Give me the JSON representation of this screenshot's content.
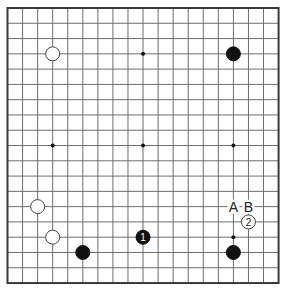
{
  "board": {
    "size": 19,
    "origin_x": 7.5,
    "origin_y": 8,
    "spacing_x": 15.06,
    "spacing_y": 15.28,
    "line_color": "#6e6e6e",
    "border_color": "#3a3a3a",
    "background": "#ffffff"
  },
  "star_points": [
    {
      "col": 3,
      "row": 3
    },
    {
      "col": 9,
      "row": 3
    },
    {
      "col": 15,
      "row": 3
    },
    {
      "col": 3,
      "row": 9
    },
    {
      "col": 9,
      "row": 9
    },
    {
      "col": 15,
      "row": 9
    },
    {
      "col": 3,
      "row": 15
    },
    {
      "col": 9,
      "row": 15
    },
    {
      "col": 15,
      "row": 15
    }
  ],
  "stones": [
    {
      "color": "white",
      "col": 3,
      "row": 3,
      "label": ""
    },
    {
      "color": "black",
      "col": 15,
      "row": 3,
      "label": ""
    },
    {
      "color": "white",
      "col": 2,
      "row": 13,
      "label": ""
    },
    {
      "color": "white",
      "col": 3,
      "row": 15,
      "label": ""
    },
    {
      "color": "black",
      "col": 5,
      "row": 16,
      "label": ""
    },
    {
      "color": "black",
      "col": 9,
      "row": 15,
      "label": "1"
    },
    {
      "color": "white",
      "col": 16,
      "row": 14,
      "label": "2"
    },
    {
      "color": "black",
      "col": 15,
      "row": 16,
      "label": ""
    }
  ],
  "markers": [
    {
      "col": 15,
      "row": 13,
      "label": "A"
    },
    {
      "col": 16,
      "row": 13,
      "label": "B"
    }
  ]
}
